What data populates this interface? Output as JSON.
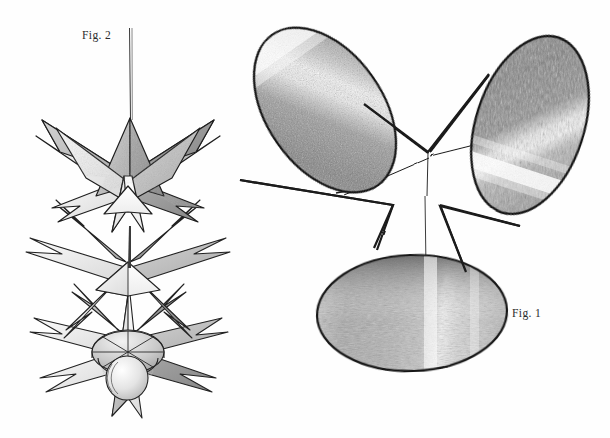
{
  "page": {
    "background_color": "#fefefe",
    "width": 610,
    "height": 438,
    "medium": "graphite pencil drawing on white paper",
    "ink_color": "#1c1c1c",
    "shading_color": "#6f6f6f"
  },
  "figures": [
    {
      "id": "fig1",
      "label": "Fig. 1",
      "label_position": {
        "x": 512,
        "y": 307
      },
      "description": "Three shaded elliptical discs joined by thin lines converging at a central point, forming a pinwheel / three-bladed star layout.",
      "elements": [
        {
          "name": "upper-left-disc",
          "shape": "ellipse",
          "center": {
            "x": 325,
            "y": 110
          },
          "radius_x": 58,
          "radius_y": 92,
          "rotation_deg": -35,
          "highlight": "diagonal light band across upper third"
        },
        {
          "name": "upper-right-disc",
          "shape": "ellipse",
          "center": {
            "x": 530,
            "y": 125
          },
          "radius_x": 54,
          "radius_y": 92,
          "rotation_deg": 18,
          "highlight": "diagonal light band across lower third"
        },
        {
          "name": "bottom-disc",
          "shape": "ellipse",
          "center": {
            "x": 412,
            "y": 313
          },
          "radius_x": 95,
          "radius_y": 58,
          "rotation_deg": -2,
          "highlight": "vertical light band right of centre, dark rim along top edge"
        },
        {
          "name": "central-vertex",
          "shape": "point",
          "position": {
            "x": 427,
            "y": 155
          }
        }
      ]
    },
    {
      "id": "fig2",
      "label": "Fig. 2",
      "label_position": {
        "x": 82,
        "y": 29
      },
      "description": "A vertically stacked three-tier star-burst ornament suspended from a thin wire, terminating in a rounded bulb base.",
      "elements": [
        {
          "name": "hanging-wire",
          "from": {
            "x": 130,
            "y": 28
          },
          "to": {
            "x": 131,
            "y": 120
          }
        },
        {
          "name": "upper-star-tier",
          "center": {
            "x": 130,
            "y": 175
          },
          "points": 7,
          "outer_radius": 90,
          "inner_radius": 36
        },
        {
          "name": "middle-star-tier",
          "center": {
            "x": 128,
            "y": 268
          },
          "points": 8,
          "outer_radius": 98,
          "inner_radius": 38
        },
        {
          "name": "lower-star-tier",
          "center": {
            "x": 128,
            "y": 345
          },
          "points": 8,
          "outer_radius": 92,
          "inner_radius": 36
        },
        {
          "name": "base-bulb",
          "center": {
            "x": 128,
            "y": 352
          },
          "radius_x": 36,
          "radius_y": 20
        },
        {
          "name": "base-sphere",
          "center": {
            "x": 127,
            "y": 378
          },
          "radius_x": 21,
          "radius_y": 22
        }
      ]
    }
  ]
}
